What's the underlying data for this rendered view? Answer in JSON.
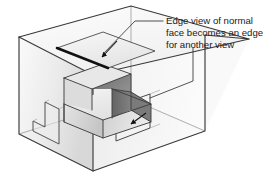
{
  "figure": {
    "type": "technical-illustration",
    "background_color": "#ffffff"
  },
  "annotation": {
    "name": "edge-view-callout",
    "lines": [
      "Edge view of normal",
      "face becomes an edge",
      "for another view"
    ],
    "line1": "Edge view of normal",
    "line2": "face becomes an edge",
    "line3": "for another view",
    "text_color": "#1a1a1a",
    "font_size_px": 9.6,
    "leader_color": "#333333"
  },
  "leaders": [
    {
      "name": "leader-to-top-edge",
      "description": "Horizontal segment from text left margin running left, then diagonally down-left to the arrowhead on the thick top edge",
      "points": "163,21 135,21 101,56",
      "arrow_tip": "101,56",
      "arrow_from": "117,41"
    },
    {
      "name": "leader-to-right-face",
      "description": "Vertical segment descending from beneath the last text line, then diagonally down-left to the top corner of the right-face rectangle",
      "points": "193,48 193,81 150,98"
    }
  ],
  "arrows": [
    {
      "name": "arrow-top-normal-face",
      "tip_x": 101,
      "tip_y": 57,
      "tail_x": 117,
      "tail_y": 41,
      "color": "#111111"
    },
    {
      "name": "arrow-right-face",
      "tip_x": 130,
      "tip_y": 124,
      "tail_x": 146,
      "tail_y": 113,
      "color": "#111111"
    }
  ],
  "colors": {
    "outline": "#3a3a3a",
    "outline_light": "#6b6b6b",
    "glass_top": "#f2f2f2",
    "glass_left_light": "#f4f4f4",
    "glass_left_dark": "#d8d8d8",
    "glass_right_light": "#fbfbfb",
    "glass_right_dark": "#e2e2e2",
    "solid_top": "#ededed",
    "solid_left": "#d4d4d4",
    "solid_right": "#c9c9c9",
    "normal_face_dark": "#707070",
    "normal_face_dark2": "#8a8a8a",
    "thick_edge": "#111111",
    "shadow": "#bdbdbd"
  },
  "parts": [
    {
      "name": "glass-box",
      "label": "Transparent reference box",
      "interactable": false
    },
    {
      "name": "edge-view-plane",
      "label": "Parallelogram plane whose lower-left boundary is drawn as a thick black edge",
      "thick_edge": true,
      "interactable": false
    },
    {
      "name": "stepped-solid",
      "label": "Stepped solid block inside the box",
      "interactable": false
    },
    {
      "name": "normal-face-highlight",
      "label": "Dark shaded normal face of the stepped solid",
      "fill": "#707070",
      "interactable": false
    },
    {
      "name": "left-face-projection",
      "label": "L-shaped projected outline on the left interior face",
      "interactable": false
    },
    {
      "name": "right-face-projection",
      "label": "Rectangular projected outline on the right interior face",
      "interactable": false
    }
  ]
}
